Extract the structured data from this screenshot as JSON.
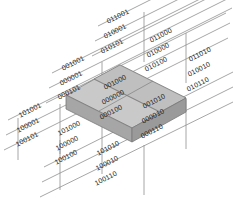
{
  "figure": {
    "title": "",
    "type": "isometric-lattice-diagram",
    "colors": {
      "background": "#ffffff",
      "line": "#8c8c8c",
      "line_dark": "#6e6e6e",
      "text": "#1a1a1a",
      "slab_top": "#c9c9c9",
      "slab_top_inner": "#bdbdbd",
      "slab_front": "#a8a8a8",
      "slab_side": "#9a9a9a",
      "slab_edge": "#7a7a7a"
    }
  },
  "labels": {
    "top_group": [
      {
        "id": "t1",
        "text": "011001",
        "x": 107,
        "y": 18,
        "rot": -27
      },
      {
        "id": "t2",
        "text": "010001",
        "x": 104,
        "y": 33,
        "rot": -27
      },
      {
        "id": "t3",
        "text": "010101",
        "x": 101,
        "y": 48,
        "rot": -27
      }
    ],
    "upper_right_group": [
      {
        "id": "ur1",
        "text": "011000",
        "x": 150,
        "y": 37,
        "rot": -27
      },
      {
        "id": "ur2",
        "text": "010000",
        "x": 147,
        "y": 52,
        "rot": -27
      },
      {
        "id": "ur3",
        "text": "010100",
        "x": 145,
        "y": 66,
        "rot": -27
      }
    ],
    "far_right_group": [
      {
        "id": "fr1",
        "text": "011010",
        "x": 189,
        "y": 56,
        "rot": -27
      },
      {
        "id": "fr2",
        "text": "010010",
        "x": 188,
        "y": 71,
        "rot": -27
      },
      {
        "id": "fr3",
        "text": "010110",
        "x": 187,
        "y": 86,
        "rot": -27
      }
    ],
    "left_mid_group": [
      {
        "id": "lm1",
        "text": "001001",
        "x": 62,
        "y": 65,
        "rot": -27
      },
      {
        "id": "lm2",
        "text": "000001",
        "x": 60,
        "y": 80,
        "rot": -27
      },
      {
        "id": "lm3",
        "text": "000101",
        "x": 58,
        "y": 94,
        "rot": -27
      }
    ],
    "center_group": [
      {
        "id": "c1",
        "text": "001000",
        "x": 104,
        "y": 84,
        "rot": -27
      },
      {
        "id": "c2",
        "text": "000000",
        "x": 102,
        "y": 99,
        "rot": -27
      },
      {
        "id": "c3",
        "text": "000100",
        "x": 100,
        "y": 114,
        "rot": -27
      }
    ],
    "right_mid_group": [
      {
        "id": "rm1",
        "text": "001010",
        "x": 143,
        "y": 103,
        "rot": -27
      },
      {
        "id": "rm2",
        "text": "000010",
        "x": 142,
        "y": 118,
        "rot": -27
      },
      {
        "id": "rm3",
        "text": "000110",
        "x": 141,
        "y": 133,
        "rot": -27
      }
    ],
    "lower_left_group": [
      {
        "id": "ll1",
        "text": "101001",
        "x": 19,
        "y": 112,
        "rot": -27
      },
      {
        "id": "ll2",
        "text": "100001",
        "x": 17,
        "y": 127,
        "rot": -27
      },
      {
        "id": "ll3",
        "text": "100101",
        "x": 16,
        "y": 141,
        "rot": -27
      }
    ],
    "lower_center_group": [
      {
        "id": "lc1",
        "text": "101000",
        "x": 58,
        "y": 130,
        "rot": -27
      },
      {
        "id": "lc2",
        "text": "100000",
        "x": 56,
        "y": 145,
        "rot": -27
      },
      {
        "id": "lc3",
        "text": "100100",
        "x": 55,
        "y": 159,
        "rot": -27
      }
    ],
    "lower_right_group": [
      {
        "id": "lr1",
        "text": "101010",
        "x": 97,
        "y": 150,
        "rot": -27
      },
      {
        "id": "lr2",
        "text": "100010",
        "x": 96,
        "y": 165,
        "rot": -27
      },
      {
        "id": "lr3",
        "text": "100110",
        "x": 95,
        "y": 180,
        "rot": -27
      }
    ]
  }
}
